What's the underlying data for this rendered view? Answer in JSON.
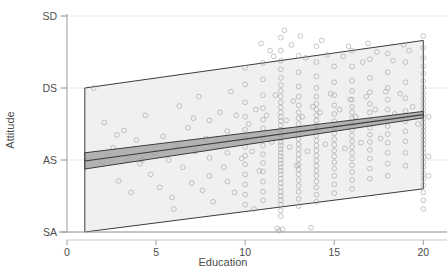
{
  "chart_data": {
    "type": "scatter",
    "title": "",
    "xlabel": "Education",
    "ylabel": "Attitude",
    "xlim": [
      0,
      20.6
    ],
    "ylim": [
      0,
      4
    ],
    "grid": true,
    "legend": null,
    "xticks": [
      {
        "value": 0,
        "label": "0"
      },
      {
        "value": 5,
        "label": "5"
      },
      {
        "value": 10,
        "label": "10"
      },
      {
        "value": 15,
        "label": "15"
      },
      {
        "value": 20,
        "label": "20"
      }
    ],
    "yticks": [
      {
        "value": 4,
        "label": "SD"
      },
      {
        "value": 3,
        "label": "DS"
      },
      {
        "value": 2,
        "label": "AS"
      },
      {
        "value": 1,
        "label": "SA"
      }
    ],
    "marker": {
      "shape": "open-circle",
      "radius": 2.4,
      "stroke": "#9a9a9a",
      "stroke_width": 0.9,
      "fill": "none",
      "opacity": 0.62
    },
    "regression_line": {
      "name": "fitted regression line",
      "color": "#3c3c3c",
      "width": 1.1,
      "x": [
        1.0,
        20.0
      ],
      "y": [
        1.985,
        2.63
      ]
    },
    "confidence_band": {
      "name": "confidence interval",
      "fill": "#9e9e9e",
      "opacity": 0.75,
      "stroke": "#3c3c3c",
      "upper": {
        "x": [
          1.0,
          20.0
        ],
        "y": [
          2.1,
          2.675
        ]
      },
      "lower": {
        "x": [
          1.0,
          20.0
        ],
        "y": [
          1.875,
          2.585
        ]
      }
    },
    "prediction_band": {
      "name": "prediction interval",
      "fill": "#f0f0f0",
      "opacity": 1,
      "stroke": "#3c3c3c",
      "upper": {
        "x": [
          1.0,
          20.0
        ],
        "y": [
          3.0,
          3.66
        ]
      },
      "lower": {
        "x": [
          1.0,
          20.0
        ],
        "y": [
          1.0,
          1.6
        ]
      }
    },
    "points": [
      [
        1.2,
        2.0
      ],
      [
        1.5,
        3.0
      ],
      [
        2.1,
        2.52
      ],
      [
        2.3,
        2.06
      ],
      [
        2.6,
        2.17
      ],
      [
        2.9,
        1.71
      ],
      [
        3.2,
        2.41
      ],
      [
        3.4,
        2.0
      ],
      [
        3.6,
        1.55
      ],
      [
        3.9,
        2.28
      ],
      [
        4.1,
        1.95
      ],
      [
        4.4,
        2.62
      ],
      [
        4.7,
        1.8
      ],
      [
        4.9,
        2.1
      ],
      [
        5.2,
        1.62
      ],
      [
        5.4,
        2.33
      ],
      [
        5.7,
        2.0
      ],
      [
        5.9,
        1.48
      ],
      [
        6.1,
        2.2
      ],
      [
        6.3,
        2.75
      ],
      [
        6.5,
        1.9
      ],
      [
        6.8,
        2.45
      ],
      [
        7.0,
        1.68
      ],
      [
        7.2,
        2.12
      ],
      [
        7.4,
        2.88
      ],
      [
        7.6,
        1.58
      ],
      [
        7.8,
        2.3
      ],
      [
        8.0,
        2.03
      ],
      [
        8.0,
        1.78
      ],
      [
        8.0,
        2.55
      ],
      [
        8.2,
        1.42
      ],
      [
        8.4,
        2.2
      ],
      [
        8.6,
        2.66
      ],
      [
        8.8,
        1.9
      ],
      [
        9.0,
        2.4
      ],
      [
        9.0,
        1.7
      ],
      [
        9.0,
        2.1
      ],
      [
        9.2,
        2.95
      ],
      [
        9.4,
        1.55
      ],
      [
        9.6,
        2.28
      ],
      [
        9.8,
        2.02
      ],
      [
        10.0,
        3.28
      ],
      [
        10.0,
        3.05
      ],
      [
        10.0,
        2.8
      ],
      [
        10.0,
        2.6
      ],
      [
        10.0,
        2.42
      ],
      [
        10.0,
        2.3
      ],
      [
        10.0,
        2.18
      ],
      [
        10.0,
        2.06
      ],
      [
        10.0,
        1.94
      ],
      [
        10.0,
        1.8
      ],
      [
        10.0,
        1.66
      ],
      [
        10.0,
        1.52
      ],
      [
        10.0,
        1.38
      ],
      [
        10.2,
        2.5
      ],
      [
        10.4,
        2.12
      ],
      [
        10.6,
        2.7
      ],
      [
        10.8,
        1.85
      ],
      [
        11.0,
        3.35
      ],
      [
        11.0,
        3.12
      ],
      [
        11.0,
        2.9
      ],
      [
        11.0,
        2.72
      ],
      [
        11.0,
        2.56
      ],
      [
        11.0,
        2.44
      ],
      [
        11.0,
        2.32
      ],
      [
        11.0,
        2.2
      ],
      [
        11.0,
        2.08
      ],
      [
        11.0,
        1.96
      ],
      [
        11.0,
        1.84
      ],
      [
        11.0,
        1.7
      ],
      [
        11.0,
        1.56
      ],
      [
        11.0,
        1.44
      ],
      [
        11.2,
        2.62
      ],
      [
        11.5,
        2.25
      ],
      [
        11.7,
        2.9
      ],
      [
        11.8,
        1.05
      ],
      [
        11.9,
        1.02
      ],
      [
        12.0,
        3.7
      ],
      [
        12.0,
        3.52
      ],
      [
        12.0,
        3.38
      ],
      [
        12.0,
        3.26
      ],
      [
        12.0,
        3.14
      ],
      [
        12.0,
        3.04
      ],
      [
        12.0,
        2.96
      ],
      [
        12.0,
        2.88
      ],
      [
        12.0,
        2.8
      ],
      [
        12.0,
        2.73
      ],
      [
        12.0,
        2.66
      ],
      [
        12.0,
        2.6
      ],
      [
        12.0,
        2.54
      ],
      [
        12.0,
        2.48
      ],
      [
        12.0,
        2.42
      ],
      [
        12.0,
        2.36
      ],
      [
        12.0,
        2.3
      ],
      [
        12.0,
        2.25
      ],
      [
        12.0,
        2.2
      ],
      [
        12.0,
        2.15
      ],
      [
        12.0,
        2.1
      ],
      [
        12.0,
        2.05
      ],
      [
        12.0,
        2.0
      ],
      [
        12.0,
        1.95
      ],
      [
        12.0,
        1.9
      ],
      [
        12.0,
        1.85
      ],
      [
        12.0,
        1.8
      ],
      [
        12.0,
        1.74
      ],
      [
        12.0,
        1.68
      ],
      [
        12.0,
        1.62
      ],
      [
        12.0,
        1.56
      ],
      [
        12.0,
        1.5
      ],
      [
        12.0,
        1.44
      ],
      [
        12.0,
        1.38
      ],
      [
        12.0,
        1.3
      ],
      [
        12.0,
        1.22
      ],
      [
        12.1,
        1.04
      ],
      [
        12.3,
        2.55
      ],
      [
        12.5,
        2.18
      ],
      [
        12.7,
        2.82
      ],
      [
        12.9,
        1.92
      ],
      [
        13.0,
        3.45
      ],
      [
        13.0,
        3.22
      ],
      [
        13.0,
        3.02
      ],
      [
        13.0,
        2.88
      ],
      [
        13.0,
        2.76
      ],
      [
        13.0,
        2.66
      ],
      [
        13.0,
        2.58
      ],
      [
        13.0,
        2.5
      ],
      [
        13.0,
        2.43
      ],
      [
        13.0,
        2.36
      ],
      [
        13.0,
        2.29
      ],
      [
        13.0,
        2.22
      ],
      [
        13.0,
        2.15
      ],
      [
        13.0,
        2.08
      ],
      [
        13.0,
        2.01
      ],
      [
        13.0,
        1.94
      ],
      [
        13.0,
        1.87
      ],
      [
        13.0,
        1.8
      ],
      [
        13.0,
        1.72
      ],
      [
        13.0,
        1.64
      ],
      [
        13.0,
        1.56
      ],
      [
        13.0,
        1.46
      ],
      [
        13.0,
        1.36
      ],
      [
        13.2,
        2.6
      ],
      [
        13.5,
        2.12
      ],
      [
        13.7,
        1.06
      ],
      [
        13.8,
        2.74
      ],
      [
        14.0,
        3.58
      ],
      [
        14.0,
        3.36
      ],
      [
        14.0,
        3.16
      ],
      [
        14.0,
        3.0
      ],
      [
        14.0,
        2.88
      ],
      [
        14.0,
        2.78
      ],
      [
        14.0,
        2.7
      ],
      [
        14.0,
        2.62
      ],
      [
        14.0,
        2.55
      ],
      [
        14.0,
        2.48
      ],
      [
        14.0,
        2.41
      ],
      [
        14.0,
        2.34
      ],
      [
        14.0,
        2.27
      ],
      [
        14.0,
        2.2
      ],
      [
        14.0,
        2.13
      ],
      [
        14.0,
        2.06
      ],
      [
        14.0,
        1.99
      ],
      [
        14.0,
        1.92
      ],
      [
        14.0,
        1.85
      ],
      [
        14.0,
        1.78
      ],
      [
        14.0,
        1.7
      ],
      [
        14.0,
        1.62
      ],
      [
        14.0,
        1.52
      ],
      [
        14.0,
        1.42
      ],
      [
        14.2,
        2.66
      ],
      [
        14.5,
        2.22
      ],
      [
        14.8,
        2.92
      ],
      [
        15.0,
        3.3
      ],
      [
        15.0,
        3.08
      ],
      [
        15.0,
        2.9
      ],
      [
        15.0,
        2.76
      ],
      [
        15.0,
        2.64
      ],
      [
        15.0,
        2.54
      ],
      [
        15.0,
        2.45
      ],
      [
        15.0,
        2.37
      ],
      [
        15.0,
        2.29
      ],
      [
        15.0,
        2.21
      ],
      [
        15.0,
        2.13
      ],
      [
        15.0,
        2.05
      ],
      [
        15.0,
        1.97
      ],
      [
        15.0,
        1.88
      ],
      [
        15.0,
        1.78
      ],
      [
        15.0,
        1.66
      ],
      [
        15.0,
        1.54
      ],
      [
        15.3,
        2.7
      ],
      [
        15.6,
        2.16
      ],
      [
        15.9,
        2.84
      ],
      [
        16.0,
        3.52
      ],
      [
        16.0,
        3.3
      ],
      [
        16.0,
        3.1
      ],
      [
        16.0,
        2.96
      ],
      [
        16.0,
        2.84
      ],
      [
        16.0,
        2.74
      ],
      [
        16.0,
        2.66
      ],
      [
        16.0,
        2.58
      ],
      [
        16.0,
        2.5
      ],
      [
        16.0,
        2.42
      ],
      [
        16.0,
        2.34
      ],
      [
        16.0,
        2.26
      ],
      [
        16.0,
        2.18
      ],
      [
        16.0,
        2.1
      ],
      [
        16.0,
        2.02
      ],
      [
        16.0,
        1.93
      ],
      [
        16.0,
        1.83
      ],
      [
        16.0,
        1.72
      ],
      [
        16.0,
        1.6
      ],
      [
        16.2,
        2.6
      ],
      [
        16.5,
        2.24
      ],
      [
        16.8,
        2.88
      ],
      [
        17.0,
        3.4
      ],
      [
        17.0,
        3.14
      ],
      [
        17.0,
        2.94
      ],
      [
        17.0,
        2.78
      ],
      [
        17.0,
        2.66
      ],
      [
        17.0,
        2.55
      ],
      [
        17.0,
        2.45
      ],
      [
        17.0,
        2.35
      ],
      [
        17.0,
        2.25
      ],
      [
        17.0,
        2.14
      ],
      [
        17.0,
        2.02
      ],
      [
        17.0,
        1.88
      ],
      [
        17.0,
        1.74
      ],
      [
        17.3,
        2.7
      ],
      [
        17.6,
        2.3
      ],
      [
        17.9,
        2.95
      ],
      [
        18.0,
        3.48
      ],
      [
        18.0,
        3.22
      ],
      [
        18.0,
        3.0
      ],
      [
        18.0,
        2.84
      ],
      [
        18.0,
        2.7
      ],
      [
        18.0,
        2.58
      ],
      [
        18.0,
        2.47
      ],
      [
        18.0,
        2.36
      ],
      [
        18.0,
        2.24
      ],
      [
        18.0,
        2.1
      ],
      [
        18.0,
        1.95
      ],
      [
        18.0,
        1.78
      ],
      [
        18.4,
        2.64
      ],
      [
        18.7,
        2.92
      ],
      [
        19.0,
        3.36
      ],
      [
        19.0,
        3.08
      ],
      [
        19.0,
        2.86
      ],
      [
        19.0,
        2.68
      ],
      [
        19.0,
        2.54
      ],
      [
        19.0,
        2.4
      ],
      [
        19.0,
        2.26
      ],
      [
        19.0,
        2.1
      ],
      [
        19.0,
        1.92
      ],
      [
        19.4,
        2.74
      ],
      [
        19.7,
        2.5
      ],
      [
        20.0,
        3.72
      ],
      [
        20.0,
        3.56
      ],
      [
        20.0,
        3.42
      ],
      [
        20.0,
        3.3
      ],
      [
        20.0,
        3.2
      ],
      [
        20.0,
        3.1
      ],
      [
        20.0,
        3.01
      ],
      [
        20.0,
        2.93
      ],
      [
        20.0,
        2.85
      ],
      [
        20.0,
        2.78
      ],
      [
        20.0,
        2.71
      ],
      [
        20.0,
        2.64
      ],
      [
        20.0,
        2.58
      ],
      [
        20.0,
        2.52
      ],
      [
        20.0,
        2.46
      ],
      [
        20.0,
        2.4
      ],
      [
        20.0,
        2.34
      ],
      [
        20.0,
        2.28
      ],
      [
        20.0,
        2.22
      ],
      [
        20.0,
        2.16
      ],
      [
        20.0,
        2.1
      ],
      [
        20.0,
        2.04
      ],
      [
        20.0,
        1.97
      ],
      [
        20.0,
        1.9
      ],
      [
        20.0,
        1.82
      ],
      [
        20.0,
        1.74
      ],
      [
        20.0,
        1.65
      ],
      [
        20.0,
        1.55
      ],
      [
        20.0,
        1.44
      ],
      [
        20.0,
        1.32
      ],
      [
        20.3,
        2.6
      ],
      [
        20.3,
        2.05
      ],
      [
        20.3,
        1.78
      ],
      [
        2.0,
        1.98
      ],
      [
        2.8,
        2.35
      ],
      [
        4.2,
        2.0
      ],
      [
        6.0,
        1.32
      ],
      [
        7.1,
        2.58
      ],
      [
        9.5,
        2.62
      ],
      [
        10.5,
        1.32
      ],
      [
        11.4,
        3.52
      ],
      [
        12.6,
        3.6
      ],
      [
        13.4,
        3.42
      ],
      [
        14.6,
        3.46
      ],
      [
        15.5,
        3.44
      ],
      [
        16.6,
        3.36
      ],
      [
        17.4,
        3.5
      ],
      [
        18.3,
        3.38
      ],
      [
        19.2,
        3.52
      ],
      [
        12.2,
        3.8
      ],
      [
        13.1,
        3.72
      ],
      [
        14.3,
        3.66
      ],
      [
        15.8,
        3.58
      ],
      [
        16.9,
        3.62
      ],
      [
        18.9,
        3.6
      ],
      [
        10.9,
        3.62
      ],
      [
        11.6,
        3.44
      ]
    ]
  }
}
